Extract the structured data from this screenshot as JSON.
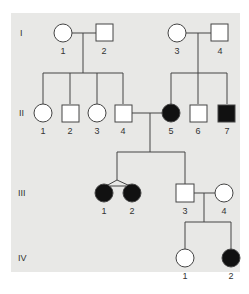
{
  "colors": {
    "panel": "#e8e8e6",
    "affected": "#111111",
    "unaffected": "#ffffff",
    "line": "#444444"
  },
  "generations": [
    {
      "label": "I",
      "y": 33
    },
    {
      "label": "II",
      "y": 113
    },
    {
      "label": "III",
      "y": 193
    },
    {
      "label": "IV",
      "y": 258
    }
  ],
  "individuals": {
    "I1": {
      "label": "1",
      "sex": "female",
      "affected": false
    },
    "I2": {
      "label": "2",
      "sex": "male",
      "affected": false
    },
    "I3": {
      "label": "3",
      "sex": "female",
      "affected": false
    },
    "I4": {
      "label": "4",
      "sex": "male",
      "affected": false
    },
    "II1": {
      "label": "1",
      "sex": "female",
      "affected": false
    },
    "II2": {
      "label": "2",
      "sex": "male",
      "affected": false
    },
    "II3": {
      "label": "3",
      "sex": "female",
      "affected": false
    },
    "II4": {
      "label": "4",
      "sex": "male",
      "affected": false
    },
    "II5": {
      "label": "5",
      "sex": "female",
      "affected": true
    },
    "II6": {
      "label": "6",
      "sex": "male",
      "affected": false
    },
    "II7": {
      "label": "7",
      "sex": "male",
      "affected": true
    },
    "III1": {
      "label": "1",
      "sex": "female",
      "affected": true,
      "twin": "identical"
    },
    "III2": {
      "label": "2",
      "sex": "female",
      "affected": true,
      "twin": "identical"
    },
    "III3": {
      "label": "3",
      "sex": "male",
      "affected": false
    },
    "III4": {
      "label": "4",
      "sex": "female",
      "affected": false
    },
    "IV1": {
      "label": "1",
      "sex": "female",
      "affected": false
    },
    "IV2": {
      "label": "2",
      "sex": "female",
      "affected": true
    }
  }
}
